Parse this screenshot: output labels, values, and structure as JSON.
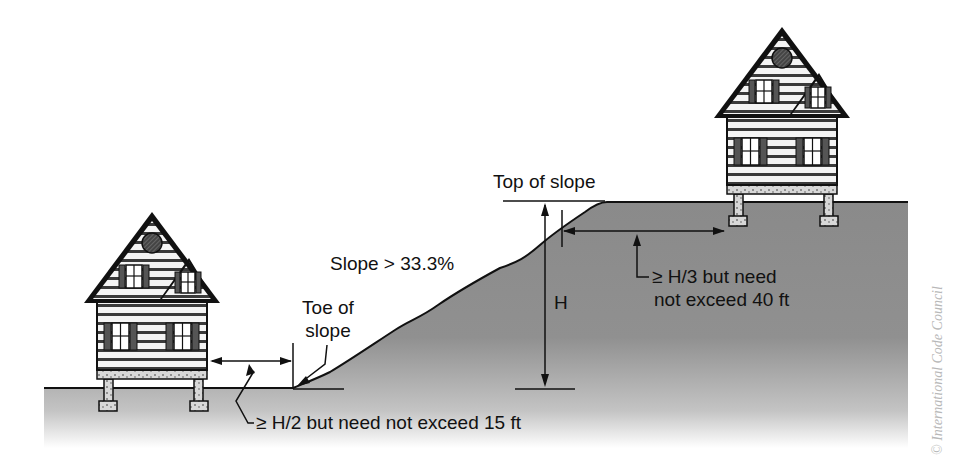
{
  "diagram": {
    "labels": {
      "top_of_slope": "Top of slope",
      "slope_grade": "Slope > 33.3%",
      "toe_of_slope_line1": "Toe of",
      "toe_of_slope_line2": "slope",
      "height": "H",
      "toe_setback_line1": "≥ H/2 but need not exceed 15 ft",
      "top_setback_line1": "≥ H/3 but need",
      "top_setback_line2": "not exceed 40 ft"
    },
    "copyright": "© International Code Council",
    "colors": {
      "ground": "#8c8c8c",
      "outline": "#111111",
      "siding": "#ffffff",
      "shutter": "#555555",
      "background": "#ffffff"
    },
    "houses": [
      {
        "id": "lower-house",
        "position": "left, below toe of slope"
      },
      {
        "id": "upper-house",
        "position": "right, above top of slope"
      }
    ]
  }
}
